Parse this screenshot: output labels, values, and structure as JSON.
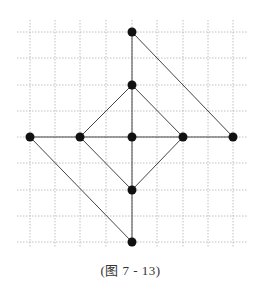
{
  "caption": "(图 7 - 13)",
  "grid": {
    "x_lines": [
      30,
      55,
      80,
      106,
      132,
      157,
      183,
      208,
      233
    ],
    "y_lines": [
      32,
      58,
      85,
      111,
      137,
      163,
      190,
      216,
      242
    ],
    "x_extent": [
      17,
      248
    ],
    "y_extent": [
      20,
      248
    ],
    "color": "#b0b0b0"
  },
  "points": [
    {
      "id": "top",
      "x": 132,
      "y": 32
    },
    {
      "id": "upper",
      "x": 132,
      "y": 85
    },
    {
      "id": "left-far",
      "x": 30,
      "y": 137
    },
    {
      "id": "left",
      "x": 80,
      "y": 137
    },
    {
      "id": "center",
      "x": 132,
      "y": 137
    },
    {
      "id": "right",
      "x": 183,
      "y": 137
    },
    {
      "id": "right-far",
      "x": 233,
      "y": 137
    },
    {
      "id": "lower",
      "x": 132,
      "y": 190
    },
    {
      "id": "bottom",
      "x": 132,
      "y": 242
    }
  ],
  "edges": [
    [
      "top",
      "upper"
    ],
    [
      "top",
      "right-far"
    ],
    [
      "upper",
      "left"
    ],
    [
      "upper",
      "right"
    ],
    [
      "upper",
      "center"
    ],
    [
      "left-far",
      "left"
    ],
    [
      "left",
      "center"
    ],
    [
      "center",
      "right"
    ],
    [
      "right",
      "right-far"
    ],
    [
      "left",
      "lower"
    ],
    [
      "right",
      "lower"
    ],
    [
      "center",
      "lower"
    ],
    [
      "lower",
      "bottom"
    ],
    [
      "left-far",
      "bottom"
    ]
  ],
  "style": {
    "line_color": "#444444",
    "point_color": "#111111",
    "point_radius": 4.5
  }
}
